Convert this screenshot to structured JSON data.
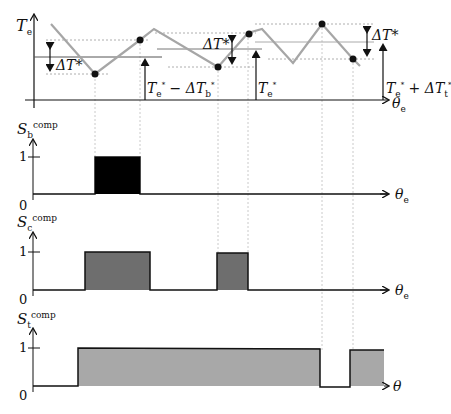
{
  "figure": {
    "top_plot": {
      "y_label": {
        "main": "T",
        "sub": "e"
      },
      "x_label": {
        "main": "θ",
        "sub": "e"
      },
      "annotations": {
        "delta_left": "ΔT*",
        "delta_mid": "ΔT*",
        "delta_right": "ΔT*",
        "level_b": {
          "a": "T",
          "a_sub": "e",
          "a_sup": "*",
          "op": " − ΔT",
          "b_sub": "b",
          "b_sup": "*"
        },
        "level_e": {
          "a": "T",
          "a_sub": "e",
          "a_sup": "*"
        },
        "level_t": {
          "a": "T",
          "a_sub": "e",
          "a_sup": "*",
          "op": " + ΔT",
          "b_sub": "t",
          "b_sup": "*"
        }
      },
      "trace_color": "#a6a6a6"
    },
    "plot_b": {
      "y_label": {
        "main": "S",
        "sub": "b",
        "sup": "comp"
      },
      "x_label": {
        "main": "θ",
        "sub": "e"
      },
      "tick_1": "1",
      "tick_0": "0",
      "fill_color": "#000000"
    },
    "plot_c": {
      "y_label": {
        "main": "S",
        "sub": "c",
        "sup": "comp"
      },
      "x_label": {
        "main": "θ",
        "sub": "e"
      },
      "tick_1": "1",
      "tick_0": "0",
      "fill_color": "#6e6e6e"
    },
    "plot_t": {
      "y_label": {
        "main": "S",
        "sub": "t",
        "sup": "comp"
      },
      "x_label": {
        "main": "θ",
        "sub": ""
      },
      "tick_1": "1",
      "tick_0": "0",
      "fill_color": "#a8a8a8"
    }
  }
}
